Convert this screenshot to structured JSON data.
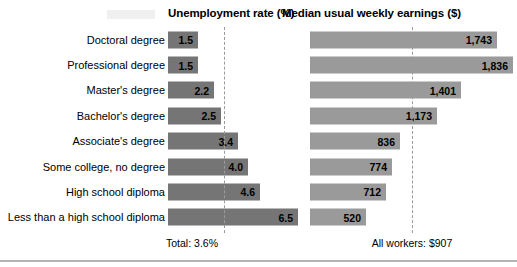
{
  "headers": {
    "unemployment": "Unemployment rate (%)",
    "earnings": "Median usual weekly earnings ($)"
  },
  "footnotes": {
    "unemployment": "Total: 3.6%",
    "earnings": "All workers: $907"
  },
  "colors": {
    "bar_left": "#757575",
    "bar_right": "#9a9a9a",
    "reference_line": "#9a9a9a",
    "text": "#000000",
    "background": "#ffffff"
  },
  "chart_data": {
    "type": "bar",
    "title": "",
    "orientation": "horizontal",
    "grid": false,
    "legend": null,
    "categories": [
      "Doctoral degree",
      "Professional degree",
      "Master's degree",
      "Bachelor's degree",
      "Associate's degree",
      "Some college, no degree",
      "High school diploma",
      "Less than a high school diploma"
    ],
    "series": [
      {
        "name": "Unemployment rate (%)",
        "xlabel": "Unemployment rate (%)",
        "unit": "%",
        "xlim": [
          0,
          7.0
        ],
        "reference_value": 3.6,
        "reference_label": "Total: 3.6%",
        "values": [
          1.5,
          1.5,
          2.2,
          2.5,
          3.4,
          4.0,
          4.6,
          6.5
        ],
        "value_labels": [
          "1.5",
          "1.5",
          "2.2",
          "2.5",
          "3.4",
          "4.0",
          "4.6",
          "6.5"
        ]
      },
      {
        "name": "Median usual weekly earnings ($)",
        "xlabel": "Median usual weekly earnings ($)",
        "unit": "$",
        "xlim": [
          0,
          2000
        ],
        "reference_value": 907,
        "reference_label": "All workers: $907",
        "values": [
          1743,
          1836,
          1401,
          1173,
          836,
          774,
          712,
          520
        ],
        "value_labels": [
          "1,743",
          "1,836",
          "1,401",
          "1,173",
          "836",
          "774",
          "712",
          "520"
        ]
      }
    ]
  },
  "rows": [
    {
      "label": "Doctoral degree",
      "rate": "1.5",
      "rate_w": 30,
      "earn": "1,743",
      "earn_w": 187
    },
    {
      "label": "Professional degree",
      "rate": "1.5",
      "rate_w": 30,
      "earn": "1,836",
      "earn_w": 203
    },
    {
      "label": "Master's degree",
      "rate": "2.2",
      "rate_w": 46,
      "earn": "1,401",
      "earn_w": 151
    },
    {
      "label": "Bachelor's degree",
      "rate": "2.5",
      "rate_w": 53,
      "earn": "1,173",
      "earn_w": 127
    },
    {
      "label": "Associate's degree",
      "rate": "3.4",
      "rate_w": 70,
      "earn": "836",
      "earn_w": 90
    },
    {
      "label": "Some college, no degree",
      "rate": "4.0",
      "rate_w": 80,
      "earn": "774",
      "earn_w": 82
    },
    {
      "label": "High school diploma",
      "rate": "4.6",
      "rate_w": 92,
      "earn": "712",
      "earn_w": 76
    },
    {
      "label": "Less than a high school diploma",
      "rate": "6.5",
      "rate_w": 130,
      "earn": "520",
      "earn_w": 56
    }
  ]
}
